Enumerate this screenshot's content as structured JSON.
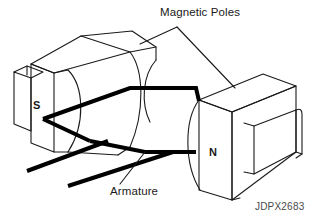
{
  "figure": {
    "code": "JDPX2683",
    "background_color": "#ffffff",
    "line_color": "#1a1a1a",
    "armature_color": "#000000",
    "code_color": "#4a4a4a",
    "width": 316,
    "height": 224
  },
  "labels": {
    "magnetic_poles": "Magnetic Poles",
    "armature": "Armature",
    "pole_south": "S",
    "pole_north": "N"
  },
  "diagram": {
    "type": "line-art-technical-illustration",
    "callouts": [
      {
        "name": "magnetic-poles-callout",
        "text": "Magnetic Poles",
        "leader_apex": [
          177,
          27
        ],
        "leader_targets": [
          [
            140,
            44
          ],
          [
            235,
            88
          ]
        ]
      },
      {
        "name": "armature-callout",
        "text": "Armature",
        "leader_apex": [
          145,
          152
        ],
        "leader_targets": [
          [
            120,
            184
          ]
        ]
      }
    ],
    "pole_south": {
      "label": "S",
      "label_position": [
        38,
        107
      ],
      "side": "left",
      "face": "concave-curved"
    },
    "pole_north": {
      "label": "N",
      "label_position": [
        214,
        154
      ],
      "side": "right",
      "face": "concave-curved"
    },
    "armature": {
      "stroke_width": 4,
      "description": "thick black wire coil loop with two leads extending to lower left"
    }
  }
}
